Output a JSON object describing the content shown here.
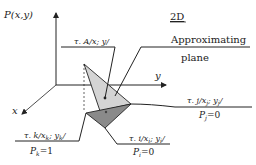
{
  "diagram": {
    "title": "2D",
    "axes": {
      "vertical": {
        "label_prefix": "P",
        "label_args": "(x,y)"
      },
      "horizontal_y": {
        "label": "y"
      },
      "diagonal_x": {
        "label": "x"
      }
    },
    "callouts": {
      "approximating_plane": {
        "line1": "Approximating",
        "line2": "plane"
      },
      "point_A": {
        "tau": "τ",
        "text": ". A/x; y/"
      },
      "point_j": {
        "tau": "τ",
        "text_pre": ". j/x",
        "sub1": "j",
        "text_mid": "; y",
        "sub2": "j",
        "text_post": "/",
        "p_label": "P",
        "p_sub": "j",
        "p_value": "=0"
      },
      "point_k": {
        "tau": "τ",
        "text_pre": ". k/x",
        "sub1": "k",
        "text_mid": "; y",
        "sub2": "k",
        "text_post": "/",
        "p_label": "P",
        "p_sub": "k",
        "p_value": "=1"
      },
      "point_i": {
        "tau": "τ",
        "text_pre": ". i/x",
        "sub1": "i",
        "text_mid": "; y",
        "sub2": "i",
        "text_post": "/",
        "p_label": "P",
        "p_sub": "i",
        "p_value": "=0"
      }
    },
    "colors": {
      "line": "#222222",
      "light_triangle": "#d4d4d4",
      "dark_triangle": "#8a8a8a"
    }
  }
}
